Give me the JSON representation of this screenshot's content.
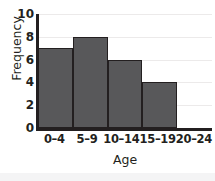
{
  "chart_data": {
    "type": "bar",
    "title": "",
    "xlabel": "Age",
    "ylabel": "Frequency",
    "categories": [
      "0–4",
      "5–9",
      "10–14",
      "15–19",
      "20–24"
    ],
    "values": [
      7,
      8,
      6,
      4,
      0
    ],
    "ylim": [
      0,
      10
    ],
    "yticks": [
      0,
      2,
      4,
      6,
      8,
      10
    ],
    "ytick_labels": [
      "0",
      "2",
      "4",
      "6",
      "8",
      "10"
    ],
    "grid": true,
    "grid_axis": "y",
    "legend": false,
    "bar_color": "#58585a",
    "bar_edge_color": "#231f20",
    "axis_color": "#231f20",
    "grid_color": "#eceaea",
    "background": "#ffffff"
  }
}
